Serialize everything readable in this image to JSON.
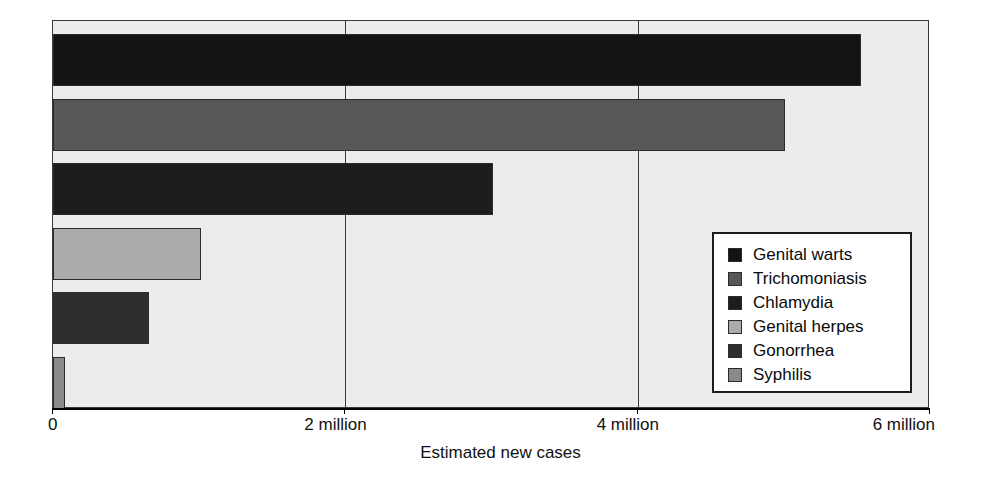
{
  "chart_data": {
    "type": "bar",
    "orientation": "horizontal",
    "title": "",
    "xlabel": "Estimated new cases",
    "ylabel": "",
    "xlim": [
      0,
      6000000
    ],
    "grid": true,
    "gridlines_x": [
      2000000,
      4000000
    ],
    "legend_position": "inside-right",
    "xtick_labels": [
      "0",
      "2 million",
      "4 million",
      "6 million"
    ],
    "xtick_values": [
      0,
      2000000,
      4000000,
      6000000
    ],
    "categories": [
      "Genital warts",
      "Trichomoniasis",
      "Chlamydia",
      "Genital herpes",
      "Gonorrhea",
      "Syphilis"
    ],
    "values": [
      5530000,
      5010000,
      3010000,
      1010000,
      660000,
      80000
    ],
    "value_labels": [
      "5.53 million",
      "5.01 million",
      "3.01 million",
      "1.01 million",
      "0.66 million",
      "0.08 million"
    ],
    "colors": [
      "#131313",
      "#575757",
      "#1d1d1d",
      "#ababab",
      "#2e2e2e",
      "#8a8a8a"
    ],
    "plot_background": "#ececec",
    "bar_edge_color": "#2b2b2b"
  },
  "legend": {
    "items": [
      {
        "label": "Genital warts",
        "color": "#131313"
      },
      {
        "label": "Trichomoniasis",
        "color": "#575757"
      },
      {
        "label": "Chlamydia",
        "color": "#1d1d1d"
      },
      {
        "label": "Genital herpes",
        "color": "#ababab"
      },
      {
        "label": "Gonorrhea",
        "color": "#2e2e2e"
      },
      {
        "label": "Syphilis",
        "color": "#8a8a8a"
      }
    ]
  }
}
